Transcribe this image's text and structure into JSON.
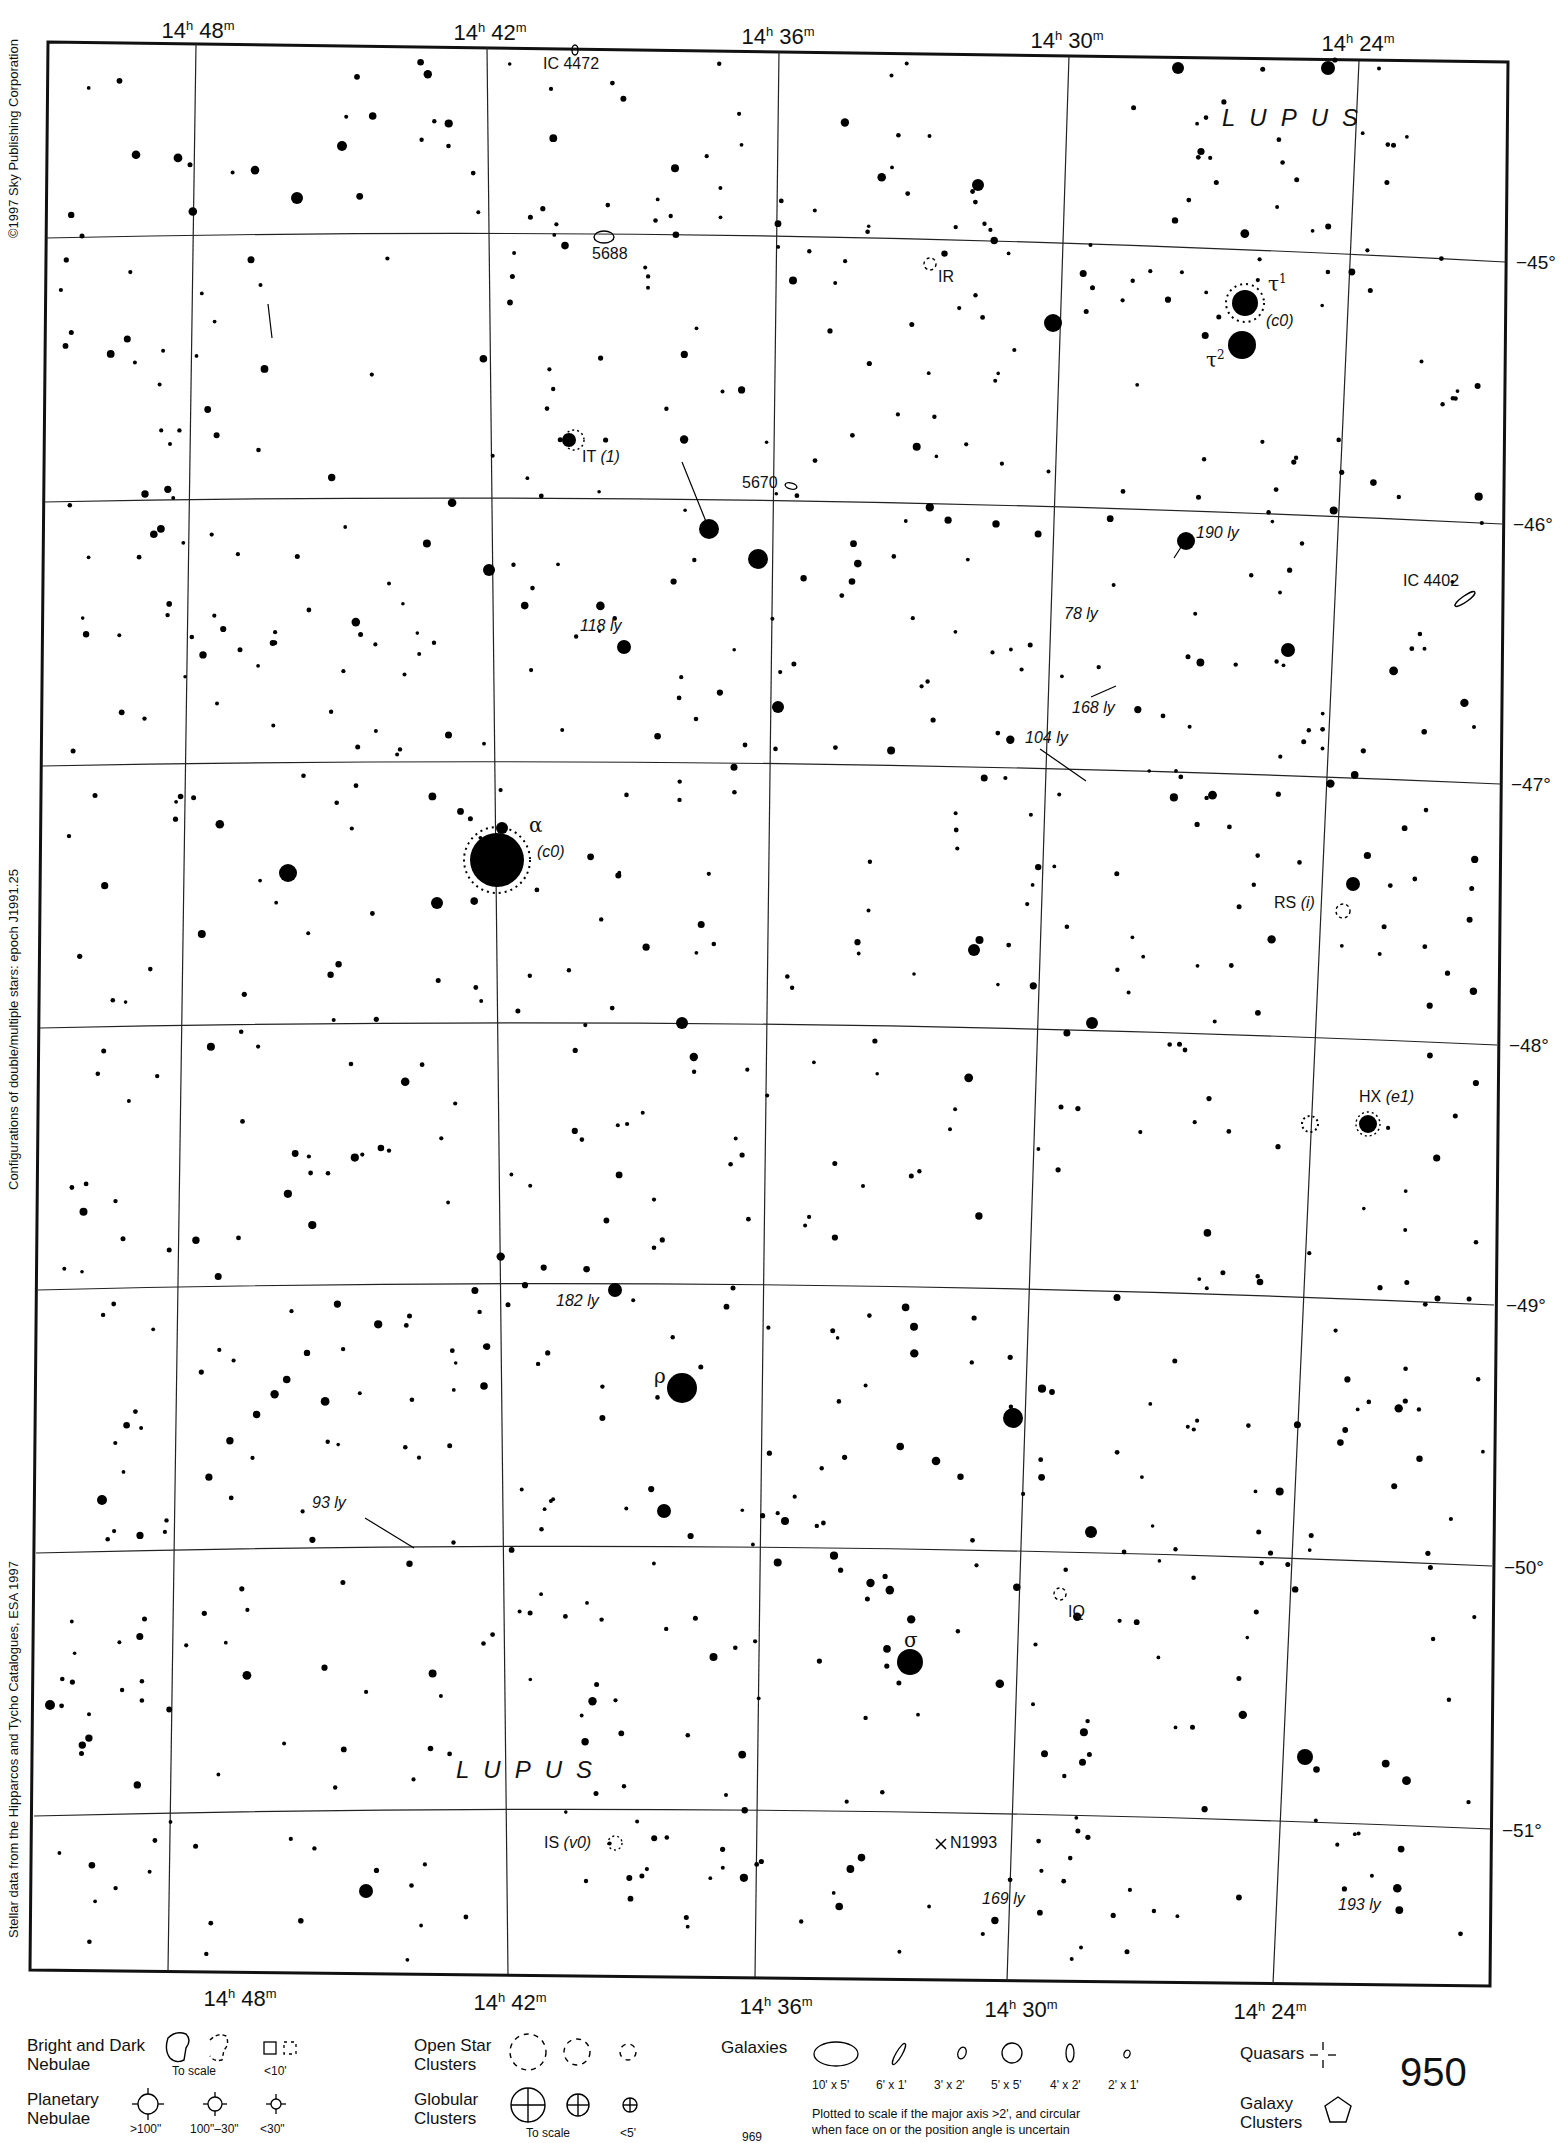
{
  "chart_data": {
    "type": "star-atlas-chart",
    "page_number": "950",
    "facing_page_number": "969",
    "constellation": "LUPUS",
    "ra_labels_top": [
      "14h 48m",
      "14h 42m",
      "14h 36m",
      "14h 30m",
      "14h 24m"
    ],
    "ra_labels_bottom": [
      "14h 48m",
      "14h 42m",
      "14h 36m",
      "14h 30m",
      "14h 24m"
    ],
    "dec_labels": [
      "-45°",
      "-46°",
      "-47°",
      "-48°",
      "-49°",
      "-50°",
      "-51°"
    ],
    "grid": true,
    "named_stars": [
      {
        "designation": "α",
        "note": "(c0)"
      },
      {
        "designation": "ρ",
        "note": ""
      },
      {
        "designation": "σ",
        "note": ""
      },
      {
        "designation": "τ1",
        "note": "(c0)"
      },
      {
        "designation": "τ2",
        "note": ""
      }
    ],
    "variable_and_labeled_stars": [
      "IT (1)",
      "RS (i)",
      "HX (e1)",
      "IS (v0)",
      "IR",
      "IQ"
    ],
    "deep_sky_objects": [
      "IC 4472",
      "5688",
      "5670",
      "IC 4402"
    ],
    "novae": [
      "N1993"
    ],
    "distance_labels": [
      "190 ly",
      "78 ly",
      "168 ly",
      "104 ly",
      "118 ly",
      "182 ly",
      "93 ly",
      "169 ly",
      "193 ly"
    ]
  },
  "map": {
    "ra_top": [
      {
        "h": "14",
        "m": "48",
        "x": 198
      },
      {
        "h": "14",
        "m": "42",
        "x": 490
      },
      {
        "h": "14",
        "m": "36",
        "x": 778
      },
      {
        "h": "14",
        "m": "30",
        "x": 1067
      },
      {
        "h": "14",
        "m": "24",
        "x": 1358
      }
    ],
    "ra_bottom": [
      {
        "h": "14",
        "m": "48",
        "x": 240
      },
      {
        "h": "14",
        "m": "42",
        "x": 510
      },
      {
        "h": "14",
        "m": "36",
        "x": 776
      },
      {
        "h": "14",
        "m": "30",
        "x": 1021
      },
      {
        "h": "14",
        "m": "24",
        "x": 1270
      }
    ],
    "dec": [
      {
        "label": "−45°",
        "y": 263
      },
      {
        "label": "−46°",
        "y": 524
      },
      {
        "label": "−47°",
        "y": 784
      },
      {
        "label": "−48°",
        "y": 1045
      },
      {
        "label": "−49°",
        "y": 1305
      },
      {
        "label": "−50°",
        "y": 1566
      },
      {
        "label": "−51°",
        "y": 1829
      }
    ],
    "constellation_top": "LUPUS",
    "constellation_bottom": "LUPUS",
    "labels": {
      "ic4472": "IC 4472",
      "n5688": "5688",
      "ir": "IR",
      "tau1": "τ",
      "tau1_sup": "1",
      "tau1_note": "(c0)",
      "tau2": "τ",
      "tau2_sup": "2",
      "it": "IT",
      "it_note": "(1)",
      "n5670": "5670",
      "ly190": "190 ly",
      "ic4402": "IC 4402",
      "ly118": "118 ly",
      "ly78": "78 ly",
      "ly168": "168 ly",
      "ly104": "104 ly",
      "alpha": "α",
      "alpha_note": "(c0)",
      "rs": "RS",
      "rs_note": "(i)",
      "hx": "HX",
      "hx_note": "(e1)",
      "ly182": "182 ly",
      "rho": "ρ",
      "ly93": "93 ly",
      "iq": "IQ",
      "sigma": "σ",
      "is": "IS",
      "is_note": "(v0)",
      "n1993": "N1993",
      "ly169": "169 ly",
      "ly193": "193 ly"
    }
  },
  "margins": {
    "copyright": "©1997 Sky Publishing Corporation",
    "epoch_note": "Configurations of double/multiple stars: epoch J1991.25",
    "data_source": "Stellar data from the Hipparcos and Tycho Catalogues, ESA 1997"
  },
  "legend": {
    "nebulae": {
      "title_1": "Bright and Dark",
      "title_2": "Nebulae",
      "cap_scale": "To scale",
      "cap_small": "<10'"
    },
    "planetary": {
      "title_1": "Planetary",
      "title_2": "Nebulae",
      "caps": [
        ">100\"",
        "100\"–30\"",
        "<30\""
      ]
    },
    "open_clusters": {
      "title_1": "Open Star",
      "title_2": "Clusters"
    },
    "globular": {
      "title_1": "Globular",
      "title_2": "Clusters",
      "cap_scale": "To scale",
      "cap_small": "<5'"
    },
    "galaxies": {
      "title": "Galaxies",
      "sizes": [
        "10' x 5'",
        "6' x 1'",
        "3' x 2'",
        "5' x 5'",
        "4' x 2'",
        "2' x 1'"
      ],
      "note_1": "Plotted to scale if the major axis >2', and circular",
      "note_2": "when face on or the position angle is uncertain"
    },
    "quasars": {
      "title": "Quasars"
    },
    "galaxy_clusters": {
      "title_1": "Galaxy",
      "title_2": "Clusters"
    }
  },
  "page": {
    "number": "950",
    "facing": "969"
  }
}
